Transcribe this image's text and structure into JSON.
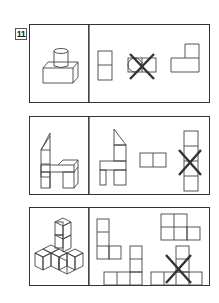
{
  "question": {
    "number": "11"
  },
  "rows": [
    {
      "id": 1,
      "solid": "cylinder-on-rectangular-block",
      "options": [
        {
          "view": "two-stacked-rectangles",
          "crossed": false
        },
        {
          "view": "circle-in-two-rectangles",
          "crossed": true
        },
        {
          "view": "l-shape-step",
          "crossed": false
        }
      ]
    },
    {
      "id": 2,
      "solid": "chair-shaped-block-assembly",
      "options": [
        {
          "view": "chair-profile-with-slanted-top",
          "crossed": false
        },
        {
          "view": "two-squares-horizontal",
          "crossed": false
        },
        {
          "view": "vertical-column-of-squares",
          "crossed": true
        }
      ]
    },
    {
      "id": 3,
      "solid": "stacked-unit-cubes",
      "options": [
        {
          "view": "l-shape-three-up-one-right",
          "crossed": false
        },
        {
          "view": "t-shape-column-on-row",
          "crossed": false
        },
        {
          "view": "two-by-two-plus-one",
          "crossed": false
        },
        {
          "view": "column-on-row-of-four",
          "crossed": true
        }
      ]
    }
  ],
  "colors": {
    "line": "#444444",
    "cross": "#333333",
    "background": "#ffffff"
  }
}
